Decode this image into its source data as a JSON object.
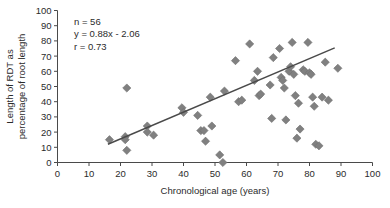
{
  "chart_data": {
    "type": "scatter",
    "title": "",
    "xlabel": "Chronological age (years)",
    "ylabel_line1": "Length of RDT as",
    "ylabel_line2": "percentage of root length",
    "xlim": [
      0,
      100
    ],
    "ylim": [
      0,
      100
    ],
    "xticks": [
      0,
      10,
      20,
      30,
      40,
      50,
      60,
      70,
      80,
      90,
      100
    ],
    "yticks": [
      0,
      10,
      20,
      30,
      40,
      50,
      60,
      70,
      80,
      90,
      100
    ],
    "grid": false,
    "legend": "none",
    "marker": "diamond",
    "marker_color": "#808080",
    "marker_edge_color": "#6e6e6e",
    "line_color": "#4a4a4a",
    "axis_color": "#4a4a4a",
    "annotations": [
      "n = 56",
      "y = 0.88x - 2.06",
      "r = 0.73"
    ],
    "fit": {
      "slope": 0.88,
      "intercept": -2.06,
      "r": 0.73,
      "n": 56,
      "x_start": 16,
      "x_end": 88
    },
    "points": [
      [
        16.5,
        15
      ],
      [
        21.5,
        17
      ],
      [
        21.5,
        15
      ],
      [
        22.0,
        8
      ],
      [
        22.0,
        49
      ],
      [
        28.5,
        24
      ],
      [
        28.5,
        20
      ],
      [
        30.5,
        18
      ],
      [
        39.5,
        36
      ],
      [
        40.0,
        33
      ],
      [
        44.5,
        31
      ],
      [
        45.5,
        21
      ],
      [
        46.5,
        21
      ],
      [
        47.0,
        14
      ],
      [
        48.5,
        43
      ],
      [
        49.0,
        24
      ],
      [
        51.5,
        5
      ],
      [
        52.5,
        0
      ],
      [
        53.0,
        47
      ],
      [
        56.5,
        67
      ],
      [
        57.5,
        40
      ],
      [
        58.5,
        41
      ],
      [
        61.0,
        78
      ],
      [
        62.5,
        54
      ],
      [
        63.5,
        60
      ],
      [
        64.0,
        44
      ],
      [
        64.5,
        45
      ],
      [
        67.5,
        51
      ],
      [
        68.0,
        29
      ],
      [
        68.5,
        69
      ],
      [
        70.5,
        75
      ],
      [
        71.0,
        56
      ],
      [
        71.5,
        54
      ],
      [
        72.0,
        49
      ],
      [
        72.5,
        28
      ],
      [
        73.5,
        60
      ],
      [
        74.0,
        63
      ],
      [
        74.5,
        79
      ],
      [
        75.0,
        58
      ],
      [
        75.5,
        44
      ],
      [
        76.0,
        16
      ],
      [
        76.5,
        39
      ],
      [
        77.0,
        22
      ],
      [
        78.0,
        61
      ],
      [
        78.5,
        60
      ],
      [
        79.5,
        79
      ],
      [
        80.0,
        59
      ],
      [
        80.5,
        58
      ],
      [
        81.0,
        43
      ],
      [
        81.5,
        37
      ],
      [
        82.0,
        12
      ],
      [
        83.0,
        11
      ],
      [
        84.0,
        43
      ],
      [
        85.0,
        66
      ],
      [
        86.0,
        41
      ],
      [
        89.0,
        62
      ]
    ]
  }
}
